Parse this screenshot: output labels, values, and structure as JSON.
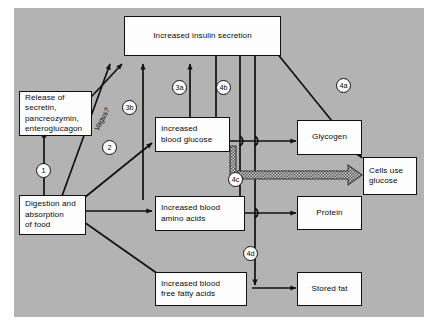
{
  "figure": {
    "type": "flow-diagram",
    "title_visible": false,
    "background_color": "#b3b3b3",
    "box_fill": "#fdfdfd",
    "line_color": "#111111"
  },
  "nodes": {
    "insulin": {
      "label": "Increased insulin secretion"
    },
    "release": {
      "label": "Release of\nsecretin,\npancreozymin,\nenteroglucagon"
    },
    "digestion": {
      "label": "Digestion and\nabsorption\nof food"
    },
    "blood_glucose": {
      "label": "Increased\nblood glucose"
    },
    "amino_acids": {
      "label": "Increased blood\namino acids"
    },
    "fatty_acids": {
      "label": "Increased blood\nfree fatty acids"
    },
    "glycogen": {
      "label": "Glycogen"
    },
    "cells_use_glucose": {
      "label": "Cells use\nglucose"
    },
    "protein": {
      "label": "Protein"
    },
    "stored_fat": {
      "label": "Stored fat"
    }
  },
  "markers": {
    "m1": "1",
    "m2": "2",
    "m3a": "3a",
    "m3b": "3b",
    "m4a": "4a",
    "m4b": "4b",
    "m4c": "4c",
    "m4d": "4d",
    "vagus": "Vagus?"
  },
  "edges": [
    {
      "from": "digestion",
      "to": "release",
      "marker": "1"
    },
    {
      "from": "digestion",
      "to": "insulin",
      "marker": "2",
      "note": "Vagus?"
    },
    {
      "from": "release",
      "to": "insulin",
      "marker": "2"
    },
    {
      "from": "digestion",
      "to": "blood_glucose",
      "marker": ""
    },
    {
      "from": "blood_glucose",
      "to": "insulin",
      "marker": "3a"
    },
    {
      "from": "digestion",
      "to": "insulin",
      "marker": "3b"
    },
    {
      "from": "digestion",
      "to": "amino_acids",
      "marker": ""
    },
    {
      "from": "digestion",
      "to": "fatty_acids",
      "marker": ""
    },
    {
      "from": "insulin",
      "to": "glycogen",
      "marker": "4b"
    },
    {
      "from": "insulin",
      "to": "cells_use_glucose",
      "marker": "4a"
    },
    {
      "from": "insulin",
      "to": "protein",
      "marker": "4c"
    },
    {
      "from": "insulin",
      "to": "stored_fat",
      "marker": "4d"
    },
    {
      "from": "blood_glucose",
      "to": "glycogen",
      "marker": ""
    },
    {
      "from": "blood_glucose",
      "to": "cells_use_glucose",
      "marker": "",
      "style": "hollow-thick"
    },
    {
      "from": "amino_acids",
      "to": "protein",
      "marker": ""
    },
    {
      "from": "fatty_acids",
      "to": "stored_fat",
      "marker": ""
    }
  ]
}
